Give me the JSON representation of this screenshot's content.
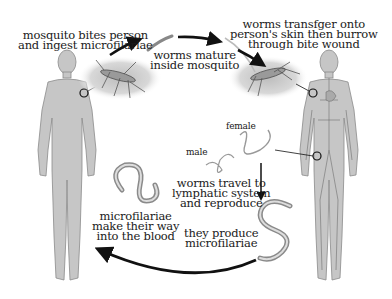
{
  "diagram": {
    "steps": [
      {
        "id": "bite",
        "lines": [
          "mosquito bites person",
          "and ingest microfilariae"
        ]
      },
      {
        "id": "mature",
        "lines": [
          "worms mature",
          "inside mosquito"
        ]
      },
      {
        "id": "transfer",
        "lines": [
          "worms transfger onto",
          "person's skin then burrow",
          "through bite wound"
        ]
      },
      {
        "id": "lymph",
        "lines": [
          "worms travel to",
          "lymphatic system",
          "and reproduce"
        ]
      },
      {
        "id": "produce",
        "lines": [
          "they produce",
          "microfilariae"
        ]
      },
      {
        "id": "blood",
        "lines": [
          "microfilariae",
          "make their way",
          "into the blood"
        ]
      }
    ],
    "worm_labels": {
      "female": "female",
      "male": "male"
    },
    "colors": {
      "body_fill": "#c8c8c8",
      "body_stroke": "#8a8a8a",
      "arrow": "#111111",
      "vessel": "#6e6e6e",
      "halo": "#d9d9d9"
    }
  }
}
